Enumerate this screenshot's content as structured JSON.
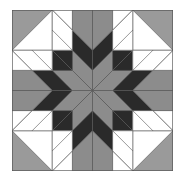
{
  "image": {
    "subject": "carpenter's wheel quilt block",
    "colors": {
      "background": "#ffffff",
      "corner_gray": "#9a9a9a",
      "dark": "#2a2a2a",
      "medium": "#8c8c8c",
      "light": "#c4c4c4",
      "white": "#ffffff",
      "outline": "#555555"
    }
  }
}
